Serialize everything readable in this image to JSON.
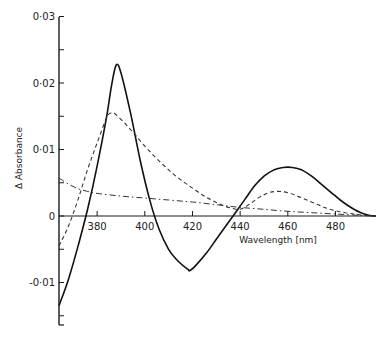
{
  "chart_data": {
    "type": "line",
    "title": "",
    "xlabel": "Wavelength [nm]",
    "ylabel": "Δ Absorbance",
    "xlim": [
      364,
      497
    ],
    "ylim": [
      -0.015,
      0.03
    ],
    "grid": false,
    "legend": null,
    "x_ticks": [
      380,
      400,
      420,
      440,
      460,
      480
    ],
    "x_tick_labels": [
      "380",
      "400",
      "420",
      "440",
      "460",
      "480"
    ],
    "y_ticks": [
      -0.01,
      0,
      0.01,
      0.02,
      0.03
    ],
    "y_tick_labels": [
      "-0·01",
      "0",
      "0·01",
      "0·02",
      "0·03"
    ],
    "series": [
      {
        "name": "solid",
        "style": "solid",
        "x": [
          364,
          368,
          372,
          376,
          380,
          384,
          386,
          388,
          390,
          394,
          398,
          402,
          406,
          410,
          414,
          418,
          419,
          422,
          426,
          430,
          434,
          438,
          442,
          446,
          450,
          454,
          458,
          462,
          466,
          470,
          474,
          478,
          482,
          486,
          490,
          494,
          497
        ],
        "y": [
          -0.0135,
          -0.0095,
          -0.0045,
          0.001,
          0.0075,
          0.015,
          0.0195,
          0.0227,
          0.0215,
          0.0155,
          0.0085,
          0.0025,
          -0.002,
          -0.005,
          -0.0068,
          -0.008,
          -0.0082,
          -0.0072,
          -0.0055,
          -0.0035,
          -0.0015,
          0.0005,
          0.0025,
          0.0045,
          0.006,
          0.0069,
          0.0073,
          0.0073,
          0.0069,
          0.006,
          0.0048,
          0.0036,
          0.0024,
          0.0014,
          0.0006,
          0.0001,
          0.0
        ]
      },
      {
        "name": "dashed",
        "style": "dashed",
        "x": [
          364,
          368,
          372,
          376,
          380,
          384,
          386,
          388,
          392,
          396,
          400,
          404,
          408,
          412,
          416,
          420,
          424,
          428,
          432,
          436,
          440,
          444,
          448,
          452,
          456,
          460,
          464,
          468,
          472,
          476,
          480,
          484,
          488,
          492,
          497
        ],
        "y": [
          -0.0045,
          -0.0015,
          0.0025,
          0.007,
          0.011,
          0.0148,
          0.0155,
          0.0152,
          0.0138,
          0.0122,
          0.0105,
          0.009,
          0.0076,
          0.0063,
          0.0052,
          0.0042,
          0.0032,
          0.0024,
          0.0017,
          0.0012,
          0.001,
          0.0018,
          0.0028,
          0.0035,
          0.0037,
          0.0035,
          0.003,
          0.0024,
          0.0018,
          0.0012,
          0.0008,
          0.0005,
          0.0003,
          0.0001,
          0.0
        ]
      },
      {
        "name": "dash-dot",
        "style": "dashdot",
        "x": [
          364,
          368,
          372,
          376,
          380,
          390,
          400,
          410,
          420,
          430,
          440,
          450,
          460,
          470,
          480,
          490,
          497
        ],
        "y": [
          0.0057,
          0.0048,
          0.0041,
          0.0037,
          0.0034,
          0.003,
          0.0027,
          0.0024,
          0.0021,
          0.0017,
          0.0013,
          0.001,
          0.0007,
          0.0005,
          0.0003,
          0.0001,
          0.0
        ]
      }
    ]
  }
}
